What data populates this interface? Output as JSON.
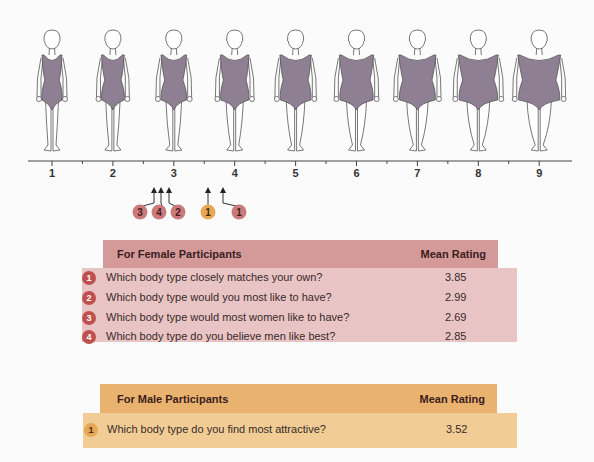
{
  "chart_data": {
    "type": "scale",
    "axis": {
      "ticks": [
        "1",
        "2",
        "3",
        "4",
        "5",
        "6",
        "7",
        "8",
        "9"
      ],
      "range": [
        1,
        9
      ],
      "half_ticks": true
    },
    "figures": [
      {
        "index": 1,
        "label": "1"
      },
      {
        "index": 2,
        "label": "2"
      },
      {
        "index": 3,
        "label": "3"
      },
      {
        "index": 4,
        "label": "4"
      },
      {
        "index": 5,
        "label": "5"
      },
      {
        "index": 6,
        "label": "6"
      },
      {
        "index": 7,
        "label": "7"
      },
      {
        "index": 8,
        "label": "8"
      },
      {
        "index": 9,
        "label": "9"
      }
    ],
    "markers": [
      {
        "group": "female",
        "number": "3",
        "value": 2.69
      },
      {
        "group": "female",
        "number": "4",
        "value": 2.85
      },
      {
        "group": "female",
        "number": "2",
        "value": 2.99
      },
      {
        "group": "male",
        "number": "1",
        "value": 3.52
      },
      {
        "group": "female",
        "number": "1",
        "value": 3.85
      }
    ],
    "series": [
      {
        "name": "For Female Participants",
        "rows": [
          {
            "number": "1",
            "question": "Which body type closely matches your own?",
            "mean_rating": 3.85
          },
          {
            "number": "2",
            "question": "Which body type would you most like to have?",
            "mean_rating": 2.99
          },
          {
            "number": "3",
            "question": "Which body type would most women like to have?",
            "mean_rating": 2.69
          },
          {
            "number": "4",
            "question": "Which body type do you believe men like best?",
            "mean_rating": 2.85
          }
        ]
      },
      {
        "name": "For Male Participants",
        "rows": [
          {
            "number": "1",
            "question": "Which body type do you find most attractive?",
            "mean_rating": 3.52
          }
        ]
      }
    ]
  },
  "colors": {
    "female_header": "#d49a9a",
    "female_body": "#e8c4c4",
    "female_badge": "#c97b7b",
    "male_header": "#e9b36f",
    "male_body": "#f1cd95",
    "male_badge": "#e7a855",
    "swimsuit": "#8e7f93"
  },
  "female_table": {
    "header": "For Female Participants",
    "col_header": "Mean Rating",
    "rows": [
      {
        "num": "1",
        "q": "Which body type closely matches your own?",
        "v": "3.85"
      },
      {
        "num": "2",
        "q": "Which body type would you most like to have?",
        "v": "2.99"
      },
      {
        "num": "3",
        "q": "Which body type would most women like to have?",
        "v": "2.69"
      },
      {
        "num": "4",
        "q": "Which body type do you believe men like best?",
        "v": "2.85"
      }
    ]
  },
  "male_table": {
    "header": "For Male Participants",
    "col_header": "Mean Rating",
    "rows": [
      {
        "num": "1",
        "q": "Which body type do you find most attractive?",
        "v": "3.52"
      }
    ]
  },
  "markers": [
    {
      "label": "3"
    },
    {
      "label": "4"
    },
    {
      "label": "2"
    },
    {
      "label": "1"
    },
    {
      "label": "1"
    }
  ],
  "axis_labels": [
    "1",
    "2",
    "3",
    "4",
    "5",
    "6",
    "7",
    "8",
    "9"
  ]
}
